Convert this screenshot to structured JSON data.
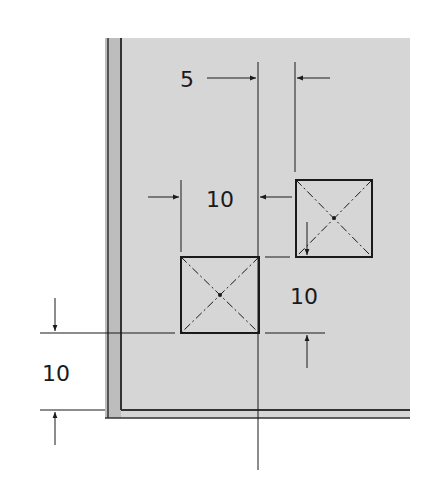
{
  "drawing": {
    "type": "engineering dimension drawing",
    "plate_color": "#d6d6d6",
    "line_color": "#1a1a1a",
    "dimensions": {
      "horizontal_gap": "5",
      "square_width": "10",
      "vertical_offset": "10",
      "edge_distance": "10"
    },
    "features": [
      {
        "name": "lower-square-cutout",
        "width": 10,
        "height": 10
      },
      {
        "name": "upper-square-cutout",
        "width": 10,
        "height": 10
      }
    ]
  }
}
